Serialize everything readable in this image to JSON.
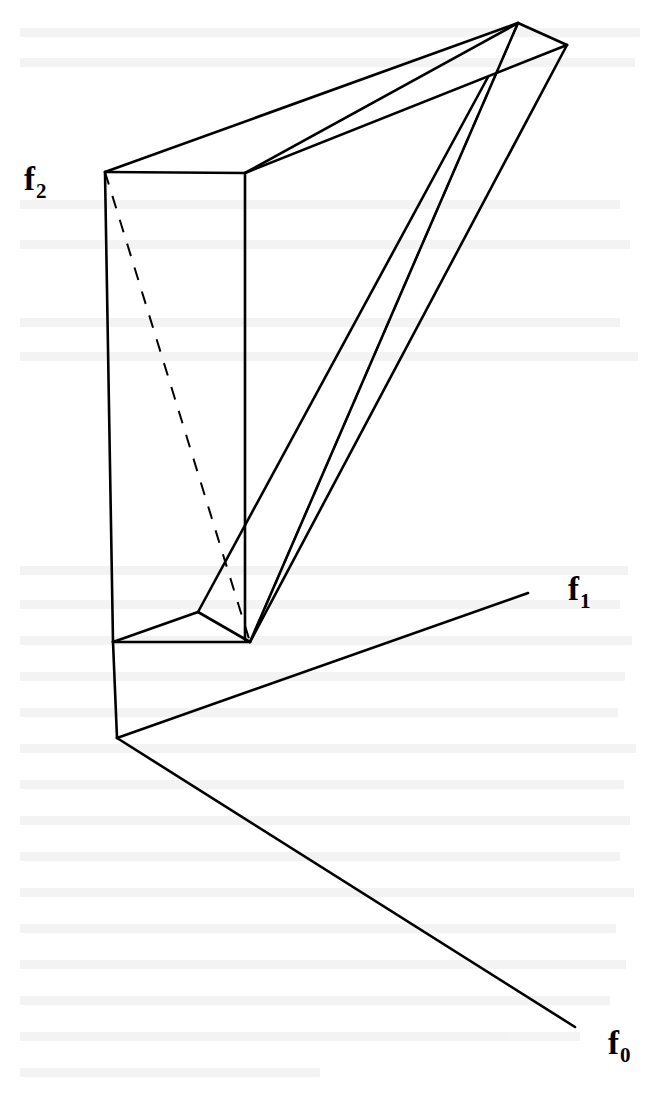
{
  "figure": {
    "kind": "line-drawing",
    "background_color": "#ffffff",
    "stroke_color": "#000000",
    "stroke_width": 2.6,
    "dashed_stroke_width": 2.0,
    "width": 671,
    "height": 1098
  },
  "labels": {
    "f2": {
      "base": "f",
      "subscript": "2",
      "x": 24,
      "y": 163
    },
    "f1": {
      "base": "f",
      "subscript": "1",
      "x": 568,
      "y": 573
    },
    "f0": {
      "base": "f",
      "subscript": "0",
      "x": 608,
      "y": 1027
    }
  },
  "geometry": {
    "origin": [
      117,
      738
    ],
    "axis_f0_end": [
      575,
      1027
    ],
    "axis_f1_end": [
      528,
      593
    ],
    "axis_f2_top": [
      105,
      172
    ],
    "box_front_top_left": [
      105,
      172
    ],
    "box_front_top_right": [
      245,
      173
    ],
    "box_front_bottom_left": [
      113,
      642
    ],
    "box_front_bottom_right": [
      250,
      642
    ],
    "box_back_top_apex": [
      518,
      23
    ],
    "box_back_top_right": [
      567,
      45
    ],
    "beam_join": [
      488,
      77
    ],
    "notch_vertex": [
      198,
      612
    ],
    "dashed_diagonal": [
      [
        105,
        172
      ],
      [
        250,
        642
      ]
    ]
  },
  "solid_paths": [
    "M105,172 L245,173",
    "M105,172 L518,23",
    "M245,173 L518,23",
    "M518,23 L567,45",
    "M245,173 L567,45",
    "M105,172 L113,642",
    "M245,173 L245,640",
    "M113,642 L250,642",
    "M113,642 L198,612",
    "M198,612 L250,642",
    "M198,612 L488,77",
    "M250,642 L518,23",
    "M250,642 L567,45",
    "M117,738 L113,642",
    "M117,738 L528,593",
    "M117,738 L575,1027"
  ],
  "dashed_paths": [
    "M105,172 L250,642",
    "M518,23 L250,642"
  ]
}
